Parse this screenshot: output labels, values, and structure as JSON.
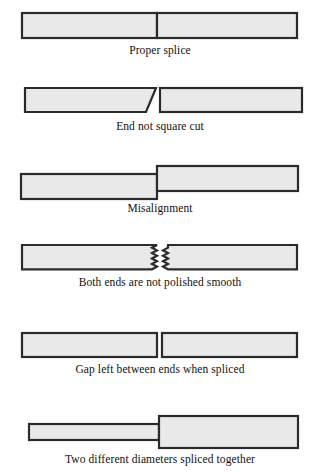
{
  "figure": {
    "background_color": "#ffffff",
    "bar_fill_color": "#e9e9e9",
    "bar_stroke_color": "#2b2b2b",
    "caption_color": "#111111"
  },
  "panels": [
    {
      "id": "proper-splice",
      "caption": "Proper splice",
      "defect_type": "none",
      "description": "Two equal bars butted flush with a single clean vertical joint line."
    },
    {
      "id": "end-not-square-cut",
      "caption": "End not square cut",
      "defect_type": "angled-end",
      "description": "Left bar terminates in a diagonal cut instead of a perpendicular face."
    },
    {
      "id": "misalignment",
      "caption": "Misalignment",
      "defect_type": "vertical-offset",
      "description": "Right bar sits higher than the left bar so the cores do not line up."
    },
    {
      "id": "ends-not-polished",
      "caption": "Both ends are not polished smooth",
      "defect_type": "rough-ends",
      "description": "Both facing ends show a jagged sawtooth profile rather than a smooth face.",
      "teeth_per_end": 9
    },
    {
      "id": "gap-between-ends",
      "caption": "Gap left between ends when spliced",
      "defect_type": "air-gap",
      "description": "A visible gap separates the two squared ends."
    },
    {
      "id": "different-diameters",
      "caption": "Two different diameters spliced together",
      "defect_type": "diameter-mismatch",
      "description": "A thin bar is joined to a noticeably thicker bar, centered on the axis."
    }
  ]
}
